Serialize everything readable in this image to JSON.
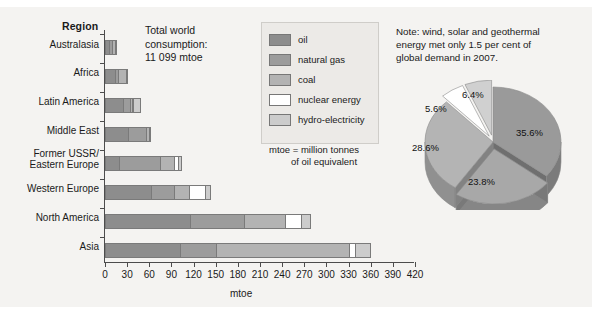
{
  "axes": {
    "region_header": "Region",
    "x_axis_title": "mtoe",
    "x_ticks": [
      "0",
      "30",
      "60",
      "90",
      "120",
      "150",
      "180",
      "210",
      "240",
      "270",
      "300",
      "330",
      "360",
      "390",
      "420"
    ]
  },
  "total_note": "Total world\nconsumption:\n11 099 mtoe",
  "legend": {
    "items": [
      {
        "label": "oil",
        "color": "#8d8d8d"
      },
      {
        "label": "natural gas",
        "color": "#9c9c9c"
      },
      {
        "label": "coal",
        "color": "#b3b3b3"
      },
      {
        "label": "nuclear energy",
        "color": "#ffffff"
      },
      {
        "label": "hydro-electricity",
        "color": "#cccccc"
      }
    ],
    "footnote_line1": "mtoe = million tonnes",
    "footnote_line2": "of oil equivalent"
  },
  "note": "Note: wind, solar and geothermal\nenergy met only 1.5 per cent of\nglobal demand in 2007.",
  "chart_data": [
    {
      "type": "bar",
      "orientation": "horizontal",
      "stacked": true,
      "title": "",
      "xlabel": "mtoe",
      "ylabel": "Region",
      "xlim": [
        0,
        420
      ],
      "xticks": [
        0,
        30,
        60,
        90,
        120,
        150,
        180,
        210,
        240,
        270,
        300,
        330,
        360,
        390,
        420
      ],
      "grid": false,
      "legend_position": "top-center",
      "categories": [
        "Australasia",
        "Africa",
        "Latin America",
        "Middle East",
        "Former USSR/\nEastern Europe",
        "Western Europe",
        "North America",
        "Asia"
      ],
      "series": [
        {
          "name": "oil",
          "color": "#8d8d8d",
          "values": [
            6,
            13,
            25,
            31,
            19,
            62,
            115,
            102
          ]
        },
        {
          "name": "natural gas",
          "color": "#9c9c9c",
          "values": [
            3,
            5,
            9,
            25,
            56,
            32,
            74,
            49
          ]
        },
        {
          "name": "coal",
          "color": "#b3b3b3",
          "values": [
            4,
            10,
            3,
            3,
            19,
            20,
            55,
            180
          ]
        },
        {
          "name": "nuclear energy",
          "color": "#ffffff",
          "values": [
            0,
            0,
            1,
            0,
            5,
            22,
            22,
            8
          ]
        },
        {
          "name": "hydro-electricity",
          "color": "#cccccc",
          "values": [
            1,
            3,
            10,
            2,
            5,
            8,
            13,
            22
          ]
        }
      ]
    },
    {
      "type": "pie",
      "title": "",
      "labels": [
        "35.6%",
        "23.8%",
        "28.6%",
        "5.6%",
        "6.4%"
      ],
      "values": [
        35.6,
        23.8,
        28.6,
        5.6,
        6.4
      ],
      "colors": [
        "#9a9a9a",
        "#a8a8a8",
        "#b4b4b4",
        "#ffffff",
        "#d0d0d0"
      ],
      "exploded": [
        false,
        true,
        false,
        true,
        true
      ],
      "three_d": true
    }
  ]
}
